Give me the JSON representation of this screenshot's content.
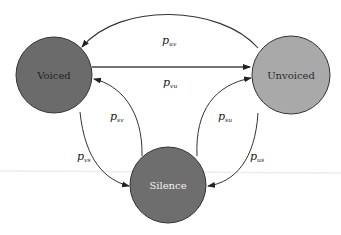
{
  "diagram": {
    "type": "state-transition",
    "nodes": [
      {
        "id": "voiced",
        "label": "Voiced",
        "fill": "#6b6b6b",
        "text_color": "#222222"
      },
      {
        "id": "unvoiced",
        "label": "Unvoiced",
        "fill": "#a9a9a9",
        "text_color": "#2a2a2a"
      },
      {
        "id": "silence",
        "label": "Silence",
        "fill": "#6e6e6e",
        "text_color": "#f2f2f2"
      }
    ],
    "edges": [
      {
        "from": "unvoiced",
        "to": "voiced",
        "label": "p",
        "subscript": "uv"
      },
      {
        "from": "voiced",
        "to": "unvoiced",
        "label": "p",
        "subscript": "vu"
      },
      {
        "from": "silence",
        "to": "voiced",
        "label": "p",
        "subscript": "sv"
      },
      {
        "from": "voiced",
        "to": "silence",
        "label": "p",
        "subscript": "vs"
      },
      {
        "from": "silence",
        "to": "unvoiced",
        "label": "p",
        "subscript": "su"
      },
      {
        "from": "unvoiced",
        "to": "silence",
        "label": "p",
        "subscript": "us"
      }
    ]
  }
}
